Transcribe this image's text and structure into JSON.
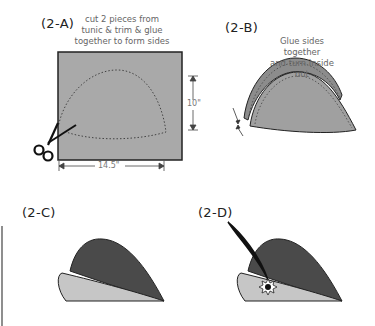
{
  "panels": [
    {
      "id": "2-A",
      "label": "(2-A)",
      "note_lines": [
        "cut 2 pieces from",
        "tunic & trim & glue",
        "together to form sides"
      ],
      "dimensions": {
        "height": "10\"",
        "width": "14.5\""
      },
      "icons": [
        "scissors-icon"
      ]
    },
    {
      "id": "2-B",
      "label": "(2-B)",
      "note_lines": [
        "Glue  sides together",
        "and turn inside out"
      ]
    },
    {
      "id": "2-C",
      "label": "(2-C)"
    },
    {
      "id": "2-D",
      "label": "(2-D)",
      "icons": [
        "feather-icon",
        "star-badge-icon"
      ]
    }
  ],
  "colors": {
    "fabric": "#a8a8a8",
    "fabric_dark": "#555555",
    "brim": "#c8c8c8",
    "outline": "#222222"
  }
}
